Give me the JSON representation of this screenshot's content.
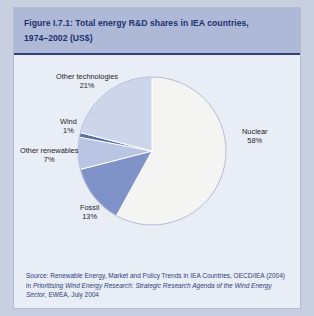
{
  "figure": {
    "title_line1": "Figure I.7.1: Total energy R&D shares in IEA countries,",
    "title_line2": "1974–2002 (US$)",
    "source_prefix": "Source: Renewable Energy, Market and Policy Trends in IEA Countries, OECD/IEA (2004) in ",
    "source_italic": "Prioritising Wind Energy Research: Strategic Research Agenda of the Wind Energy Sector",
    "source_suffix": ", EWEA, July 2004"
  },
  "labels": {
    "other_technologies": "Other technologies",
    "other_technologies_pct": "21%",
    "wind": "Wind",
    "wind_pct": "1%",
    "other_renewables": "Other renewables",
    "other_renewables_pct": "7%",
    "fossil": "Fossil",
    "fossil_pct": "13%",
    "nuclear": "Nuclear",
    "nuclear_pct": "58%"
  },
  "colors": {
    "panel_bg": "#e9edf6",
    "title_bg": "#aeb9d8",
    "title_text": "#20306e",
    "title_rule": "#2e3f7e",
    "source_text": "#2d3e7b",
    "slice_nuclear": "#f4f4f2",
    "slice_other_technologies": "#ccd5ea",
    "slice_fossil": "#7f93c8",
    "slice_other_renewables": "#b9c5e2",
    "slice_wind": "#5b6fa8",
    "slice_outline": "#ffffff",
    "pie_edge": "#8e9bc4"
  },
  "chart_data": {
    "type": "pie",
    "title": "Figure I.7.1: Total energy R&D shares in IEA countries, 1974–2002 (US$)",
    "unit": "percent",
    "categories": [
      "Nuclear",
      "Fossil",
      "Other renewables",
      "Wind",
      "Other technologies"
    ],
    "values": [
      58,
      13,
      7,
      1,
      21
    ],
    "slices": [
      {
        "name": "Nuclear",
        "value": 58,
        "label": "Nuclear",
        "pct_label": "58%",
        "color": "#f4f4f2"
      },
      {
        "name": "Fossil",
        "value": 13,
        "label": "Fossil",
        "pct_label": "13%",
        "color": "#7f93c8"
      },
      {
        "name": "Other renewables",
        "value": 7,
        "label": "Other renewables",
        "pct_label": "7%",
        "color": "#b9c5e2"
      },
      {
        "name": "Wind",
        "value": 1,
        "label": "Wind",
        "pct_label": "1%",
        "color": "#5b6fa8"
      },
      {
        "name": "Other technologies",
        "value": 21,
        "label": "Other technologies",
        "pct_label": "21%",
        "color": "#ccd5ea"
      }
    ],
    "total": 100,
    "start_angle_deg": 0,
    "direction": "clockwise",
    "legend": "none",
    "labels_position": "outside",
    "grid": false
  }
}
